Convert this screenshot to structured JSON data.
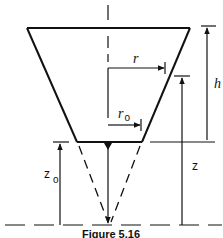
{
  "figure": {
    "caption": "Figure 5.16",
    "labels": {
      "r": "r",
      "r0_main": "r",
      "r0_sub": "o",
      "h": "h",
      "z": "z",
      "z0_main": "z",
      "z0_sub": "o"
    },
    "colors": {
      "stroke": "#111111",
      "background": "#ffffff"
    }
  }
}
